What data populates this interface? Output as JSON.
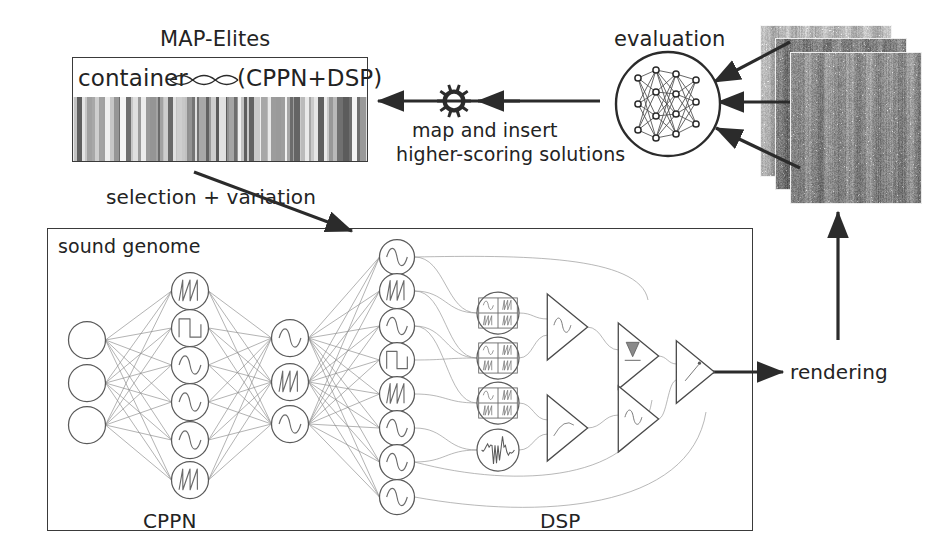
{
  "diagram": {
    "stroke_color": "#2b2b2b",
    "text_color": "#232323"
  },
  "map_elites": {
    "title": "MAP-Elites",
    "container_label": "container",
    "genotype_label": "(CPPN+DSP)",
    "helix_icon": "dna-helix-icon",
    "archive_icon": "archive-heatmap-strip"
  },
  "edges": {
    "selection_variation": "selection + variation",
    "map_insert_line1": "map and insert",
    "map_insert_line2": "higher-scoring solutions",
    "gear_icon": "gear-icon",
    "rendering": "rendering"
  },
  "evaluation": {
    "title": "evaluation",
    "model_top": "YAMNet",
    "model_bottom": "DNN",
    "network_icon": "neural-network-icon",
    "input_count": 3
  },
  "spectrograms": {
    "count": 3,
    "icon": "spectrogram-stack-icon"
  },
  "sound_genome": {
    "title": "sound genome",
    "cppn_label": "CPPN",
    "dsp_label": "DSP",
    "cppn": {
      "inputs": [
        {
          "glyph": "plain"
        },
        {
          "glyph": "plain"
        },
        {
          "glyph": "plain"
        }
      ],
      "hidden": [
        {
          "glyph": "sawtooth"
        },
        {
          "glyph": "square"
        },
        {
          "glyph": "sine"
        },
        {
          "glyph": "sine"
        },
        {
          "glyph": "sine"
        },
        {
          "glyph": "sawtooth"
        }
      ],
      "middle": [
        {
          "glyph": "sine"
        },
        {
          "glyph": "sawtooth"
        },
        {
          "glyph": "sine"
        }
      ]
    },
    "dsp": {
      "oscillators": [
        {
          "glyph": "sine"
        },
        {
          "glyph": "sawtooth"
        },
        {
          "glyph": "sine"
        },
        {
          "glyph": "square"
        },
        {
          "glyph": "sawtooth"
        },
        {
          "glyph": "sine"
        },
        {
          "glyph": "sine"
        },
        {
          "glyph": "sine"
        }
      ],
      "modules": [
        {
          "glyph": "wavetable-grid"
        },
        {
          "glyph": "wavetable-grid"
        },
        {
          "glyph": "wavetable-grid"
        },
        {
          "glyph": "noise"
        }
      ],
      "units": [
        {
          "glyph": "sine-amp"
        },
        {
          "glyph": "ramp-amp"
        },
        {
          "glyph": "filter-amp"
        },
        {
          "glyph": "reverb-amp"
        },
        {
          "glyph": "output-amp"
        }
      ]
    }
  }
}
